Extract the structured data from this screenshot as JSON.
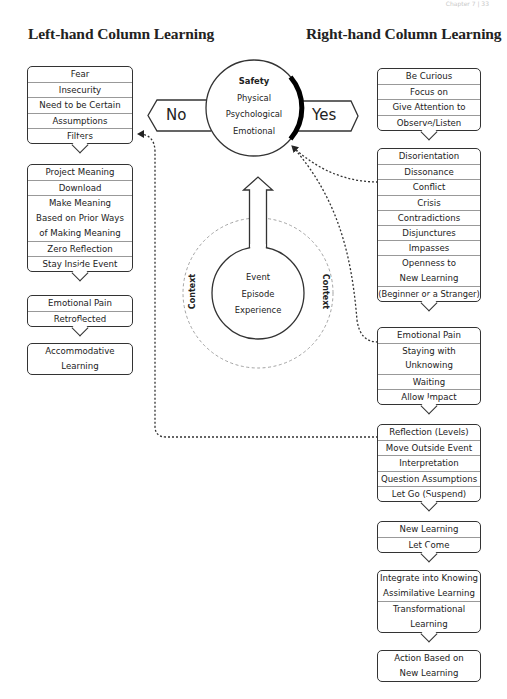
{
  "page_header": "Chapter 7 | 33",
  "titles": {
    "left": "Left-hand Column Learning",
    "right": "Right-hand Column Learning"
  },
  "center": {
    "no_label": "No",
    "yes_label": "Yes",
    "safety": {
      "title": "Safety",
      "items": [
        "Physical",
        "Psychological",
        "Emotional"
      ]
    },
    "event": {
      "items": [
        "Event",
        "Episode",
        "Experience"
      ]
    },
    "context_left": "Context",
    "context_right": "Context"
  },
  "left_column": {
    "boxes": [
      {
        "rows": [
          [
            "Fear"
          ],
          [
            "Insecurity"
          ],
          [
            "Need to be Certain"
          ],
          [
            "Assumptions"
          ],
          [
            "Filters"
          ]
        ]
      },
      {
        "rows": [
          [
            "Project Meaning"
          ],
          [
            "Download"
          ],
          [
            "Make Meaning",
            "Based on Prior Ways",
            "of Making Meaning"
          ],
          [
            "Zero Reflection"
          ],
          [
            "Stay Inside Event"
          ]
        ]
      },
      {
        "rows": [
          [
            "Emotional Pain"
          ],
          [
            "Retroflected"
          ]
        ]
      },
      {
        "rows": [
          [
            "Accommodative",
            "Learning"
          ]
        ]
      }
    ]
  },
  "right_column": {
    "boxes": [
      {
        "rows": [
          [
            "Be Curious"
          ],
          [
            "Focus on"
          ],
          [
            "Give Attention to"
          ],
          [
            "Observe/Listen"
          ]
        ]
      },
      {
        "rows": [
          [
            "Disorientation"
          ],
          [
            "Dissonance"
          ],
          [
            "Conflict"
          ],
          [
            "Crisis"
          ],
          [
            "Contradictions"
          ],
          [
            "Disjunctures"
          ],
          [
            "Impasses"
          ],
          [
            "Openness to",
            "New Learning"
          ],
          [
            "(Beginner or a Stranger)"
          ]
        ]
      },
      {
        "rows": [
          [
            "Emotional Pain"
          ],
          [
            "Staying with",
            "Unknowing"
          ],
          [
            "Waiting"
          ],
          [
            "Allow Impact"
          ]
        ]
      },
      {
        "rows": [
          [
            "Reflection (Levels)"
          ],
          [
            "Move Outside Event"
          ],
          [
            "Interpretation"
          ],
          [
            "Question Assumptions"
          ],
          [
            "Let Go (Suspend)"
          ]
        ]
      },
      {
        "rows": [
          [
            "New Learning"
          ],
          [
            "Let Come"
          ]
        ]
      },
      {
        "rows": [
          [
            "Integrate into Knowing",
            "Assimilative Learning"
          ],
          [
            "Transformational",
            "Learning"
          ]
        ]
      },
      {
        "rows": [
          [
            "Action Based on",
            "New Learning"
          ]
        ]
      }
    ]
  },
  "colors": {
    "line": "#333333",
    "divider": "#999999",
    "dashed_context": "#999999",
    "safety_bar": "#000000"
  }
}
